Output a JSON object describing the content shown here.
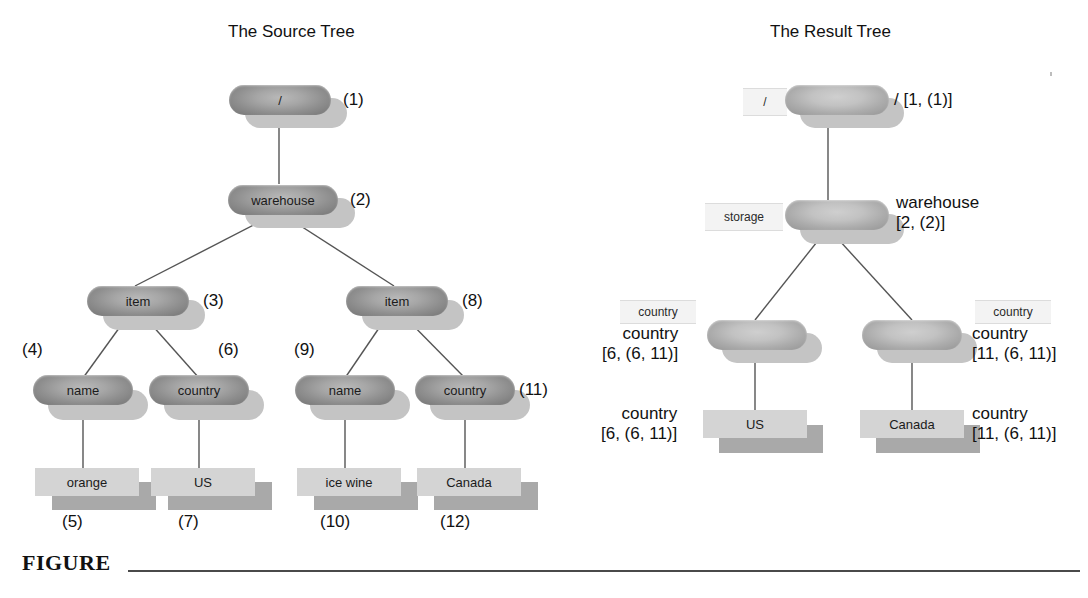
{
  "figure": {
    "caption_word": "FIGURE"
  },
  "source_tree": {
    "title": "The Source Tree",
    "nodes": [
      {
        "label": "/",
        "tag": "(1)"
      },
      {
        "label": "warehouse",
        "tag": "(2)"
      },
      {
        "label": "item",
        "tag": "(3)"
      },
      {
        "label": "name",
        "tag": "(4)"
      },
      {
        "label": "orange",
        "tag": "(5)"
      },
      {
        "label": "country",
        "tag": "(6)"
      },
      {
        "label": "US",
        "tag": "(7)"
      },
      {
        "label": "item",
        "tag": "(8)"
      },
      {
        "label": "name",
        "tag": "(9)"
      },
      {
        "label": "ice wine",
        "tag": "(10)"
      },
      {
        "label": "country",
        "tag": "(11)"
      },
      {
        "label": "Canada",
        "tag": "(12)"
      }
    ]
  },
  "result_tree": {
    "title": "The Result Tree",
    "nodes": [
      {
        "box": "/",
        "label": "/ [1, (1)]"
      },
      {
        "box": "storage",
        "label": "warehouse\n[2, (2)]"
      },
      {
        "box": "country",
        "label": "country\n[6, (6, 11)]"
      },
      {
        "box": "country",
        "label": "country\n[11, (6, 11)]"
      },
      {
        "leaf": "US",
        "label": "country\n[6, (6, 11)]"
      },
      {
        "leaf": "Canada",
        "label": "country\n[11, (6, 11)]"
      }
    ]
  },
  "colors": {
    "node_fill": "#a0a0a0",
    "node_shadow": "#c4c4c4",
    "leaf_fill": "#d4d4d4",
    "leaf_shadow": "#a9a9a9",
    "palebox_fill": "#f3f3f3",
    "edge_stroke": "#555555",
    "text": "#111111"
  }
}
